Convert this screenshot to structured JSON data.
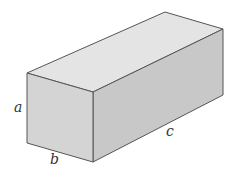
{
  "figure": {
    "type": "rectangular box (cuboid)",
    "labels": {
      "height": "a",
      "width": "b",
      "length": "c"
    },
    "colors": {
      "top_face": "#e4e4e4",
      "front_face": "#d2d2d2",
      "side_face": "#c6c6c6",
      "edge": "#555555",
      "label": "#333333"
    }
  }
}
